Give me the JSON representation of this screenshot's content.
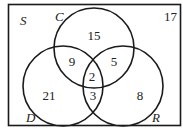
{
  "diagram": {
    "type": "venn-3",
    "universal_label": "S",
    "outside_count": "17",
    "sets": [
      {
        "id": "C",
        "label": "C"
      },
      {
        "id": "D",
        "label": "D"
      },
      {
        "id": "R",
        "label": "R"
      }
    ],
    "regions": {
      "C_only": "15",
      "C_and_D_only": "9",
      "C_and_R_only": "5",
      "C_D_R": "2",
      "D_and_R_only": "3",
      "D_only": "21",
      "R_only": "8"
    },
    "stroke_color": "#1a1a1a"
  }
}
